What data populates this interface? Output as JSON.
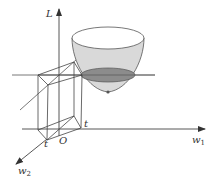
{
  "figure": {
    "axes": {
      "vertical": {
        "label": "L"
      },
      "horizontal": {
        "label": "w",
        "subscript": "1"
      },
      "depth": {
        "label": "w",
        "subscript": "2"
      },
      "origin": {
        "label": "O"
      }
    },
    "constraint_labels": {
      "t_right": "t",
      "t_front": "t"
    },
    "colors": {
      "line": "#444444",
      "bowl_fill": "#d9d9d9",
      "contour_fill": "#8c8c8c",
      "bowl_top": "#ffffff",
      "background": "#ffffff"
    }
  }
}
